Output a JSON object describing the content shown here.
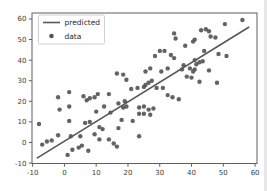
{
  "figure": {
    "background": "#ffffff",
    "plot_background": "#ffffff",
    "spine_color": "#5f5f5f",
    "tick_color": "#4a4a4a",
    "tick_label_color": "#3c3c3c",
    "legend_border_color": "#cbcbcb",
    "legend_background": "#ffffff",
    "legend_text_color": "#2a2a2a",
    "edge_artifact_color": "#e7e7e7"
  },
  "chart_data": {
    "type": "scatter",
    "title": "",
    "xlabel": "",
    "ylabel": "",
    "xlim": [
      -10.2,
      60.6
    ],
    "ylim": [
      -10.2,
      62.9
    ],
    "xticks": [
      -10,
      0,
      10,
      20,
      30,
      40,
      50,
      60
    ],
    "yticks": [
      -10,
      0,
      10,
      20,
      30,
      40,
      50,
      60
    ],
    "grid": false,
    "legend": {
      "position": "upper-left",
      "entries": [
        {
          "label": "predicted",
          "swatch": "line"
        },
        {
          "label": "data",
          "swatch": "dot"
        }
      ]
    },
    "series": [
      {
        "name": "predicted",
        "type": "line",
        "color": "#585858",
        "line_width": 1.6,
        "x": [
          -8.5,
          58
        ],
        "y": [
          -7.5,
          56
        ]
      },
      {
        "name": "data",
        "type": "scatter",
        "color": "#565656",
        "marker_radius": 2.2,
        "points": [
          [
            -8,
            9
          ],
          [
            -7,
            -1
          ],
          [
            -5.5,
            0.5
          ],
          [
            -4,
            1
          ],
          [
            -2,
            3.5
          ],
          [
            -2,
            22
          ],
          [
            -1.5,
            16
          ],
          [
            1.5,
            24.5
          ],
          [
            1.5,
            17.5
          ],
          [
            1.5,
            10.5
          ],
          [
            1,
            -6
          ],
          [
            2,
            3
          ],
          [
            2.5,
            -3.5
          ],
          [
            4.5,
            -2.5
          ],
          [
            5.5,
            -1.5
          ],
          [
            5,
            3
          ],
          [
            6.5,
            9.5
          ],
          [
            8,
            10
          ],
          [
            7.5,
            -4
          ],
          [
            9.5,
            4
          ],
          [
            11,
            7.5
          ],
          [
            12,
            6.5
          ],
          [
            11,
            1.5
          ],
          [
            6,
            22.5
          ],
          [
            7,
            20.5
          ],
          [
            8,
            21.5
          ],
          [
            9.5,
            22
          ],
          [
            10.5,
            23.5
          ],
          [
            14,
            23.5
          ],
          [
            12.5,
            17.5
          ],
          [
            10,
            15
          ],
          [
            14.5,
            14.5
          ],
          [
            14,
            1.5
          ],
          [
            15.5,
            -0.5
          ],
          [
            16.5,
            -2
          ],
          [
            17,
            7
          ],
          [
            18,
            11
          ],
          [
            21.5,
            10.5
          ],
          [
            17,
            19
          ],
          [
            18.5,
            17
          ],
          [
            19.5,
            17.5
          ],
          [
            19,
            20
          ],
          [
            16.5,
            33.5
          ],
          [
            18.5,
            33
          ],
          [
            19.5,
            30.5
          ],
          [
            21,
            26
          ],
          [
            23,
            26.5
          ],
          [
            25,
            27
          ],
          [
            23.5,
            17
          ],
          [
            25,
            17.5
          ],
          [
            23.5,
            14
          ],
          [
            25,
            14
          ],
          [
            26.5,
            16
          ],
          [
            28,
            16.5
          ],
          [
            27,
            13.5
          ],
          [
            23.5,
            3
          ],
          [
            25.5,
            34.5
          ],
          [
            27,
            36
          ],
          [
            27.5,
            30
          ],
          [
            26.5,
            29
          ],
          [
            25.5,
            28
          ],
          [
            29,
            26.5
          ],
          [
            31,
            26.5
          ],
          [
            32.5,
            23
          ],
          [
            34,
            22
          ],
          [
            36,
            21
          ],
          [
            28.5,
            42
          ],
          [
            30,
            44.5
          ],
          [
            31.5,
            44.5
          ],
          [
            30.5,
            34.5
          ],
          [
            32.5,
            36
          ],
          [
            33.5,
            42.5
          ],
          [
            34.5,
            41
          ],
          [
            34.5,
            53
          ],
          [
            35,
            50.5
          ],
          [
            37.5,
            37.5
          ],
          [
            37,
            35.5
          ],
          [
            39.5,
            36
          ],
          [
            41,
            35.5
          ],
          [
            40.5,
            34.5
          ],
          [
            41.5,
            38
          ],
          [
            42.5,
            39
          ],
          [
            38.5,
            32
          ],
          [
            40,
            31.5
          ],
          [
            42.5,
            29.5
          ],
          [
            45.5,
            35
          ],
          [
            48,
            29
          ],
          [
            38,
            47
          ],
          [
            40.5,
            49
          ],
          [
            41,
            50
          ],
          [
            44,
            44.5
          ],
          [
            46,
            51.5
          ],
          [
            47.5,
            51
          ],
          [
            43,
            54.5
          ],
          [
            44.5,
            55
          ],
          [
            45.5,
            54
          ],
          [
            48.5,
            43
          ],
          [
            51,
            42
          ],
          [
            41,
            40
          ],
          [
            43.5,
            39.5
          ],
          [
            50.5,
            57.5
          ],
          [
            56,
            59.5
          ]
        ]
      }
    ]
  }
}
